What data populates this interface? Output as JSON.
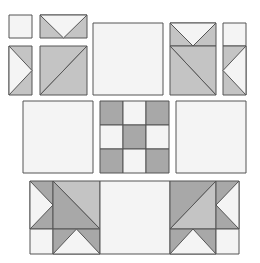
{
  "colors": {
    "light": "#f4f4f4",
    "medium": "#c4c4c4",
    "dark": "#a8a8a8",
    "stroke": "#555555",
    "background": "#ffffff"
  },
  "rows": [
    {
      "name": "top-row",
      "units": [
        {
          "name": "small-square-top-left",
          "type": "square",
          "fill": "light",
          "x": 9,
          "y": 15,
          "w": 23,
          "h": 23
        },
        {
          "name": "flying-geese-top-left",
          "type": "flying-geese-down",
          "x": 40,
          "y": 15,
          "w": 47,
          "h": 23
        },
        {
          "name": "side-triangle-unit-left",
          "type": "flying-geese-right",
          "x": 9,
          "y": 46,
          "w": 23,
          "h": 49
        },
        {
          "name": "half-square-triangle-left",
          "type": "hst-slash",
          "x": 40,
          "y": 46,
          "w": 47,
          "h": 49
        },
        {
          "name": "plain-square-top-center",
          "type": "square",
          "fill": "light",
          "x": 93,
          "y": 23,
          "w": 70,
          "h": 72
        },
        {
          "name": "flying-geese-top-right",
          "type": "flying-geese-down",
          "x": 170,
          "y": 23,
          "w": 46,
          "h": 23
        },
        {
          "name": "half-square-triangle-right",
          "type": "hst-backslash",
          "x": 170,
          "y": 46,
          "w": 46,
          "h": 49
        },
        {
          "name": "small-square-top-right",
          "type": "square",
          "fill": "light",
          "x": 223,
          "y": 23,
          "w": 23,
          "h": 23
        },
        {
          "name": "side-triangle-unit-right",
          "type": "flying-geese-left",
          "x": 223,
          "y": 46,
          "w": 23,
          "h": 49
        }
      ]
    },
    {
      "name": "middle-row",
      "units": [
        {
          "name": "plain-square-middle-left",
          "type": "square",
          "fill": "light",
          "x": 23,
          "y": 101,
          "w": 70,
          "h": 72
        },
        {
          "name": "nine-patch-center",
          "type": "nine-patch",
          "x": 100,
          "y": 101,
          "w": 69,
          "h": 72
        },
        {
          "name": "plain-square-middle-right",
          "type": "square",
          "fill": "light",
          "x": 176,
          "y": 101,
          "w": 70,
          "h": 72
        }
      ]
    },
    {
      "name": "bottom-row",
      "units": [
        {
          "name": "assembled-corner-block-left",
          "type": "corner-left",
          "x": 30,
          "y": 181,
          "w": 70,
          "h": 73
        },
        {
          "name": "plain-square-bottom-center",
          "type": "square",
          "fill": "light",
          "x": 100,
          "y": 181,
          "w": 70,
          "h": 73
        },
        {
          "name": "assembled-corner-block-right",
          "type": "corner-right",
          "x": 170,
          "y": 181,
          "w": 69,
          "h": 73
        }
      ]
    }
  ]
}
